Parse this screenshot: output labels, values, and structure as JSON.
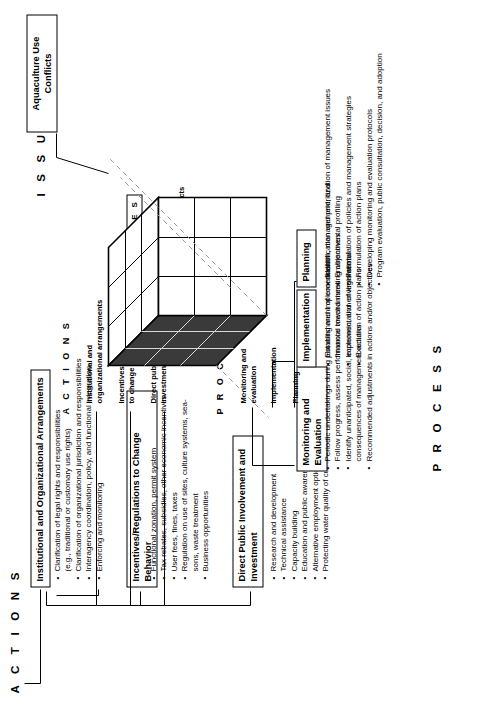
{
  "figure": {
    "axis_actions": "A C T I O N S",
    "axis_issues": "I S S U E S",
    "axis_process": "P R O C E S S",
    "axis_issues_small": "I S S U E S",
    "axis_actions_small": "A C T I O N S",
    "axis_process_small": "P R O C E S S"
  },
  "actions": {
    "groups": [
      {
        "title": "Institutional and Organizational Arrangements",
        "bullets": [
          "Clarification of legal rights and responsibilities",
          "(e.g., traditional or customary use rights)",
          "Clarification of organizational jurisdiction and responsibilities",
          "Interagency coordination, policy, and functional integration",
          "Enforcing and monitoring"
        ]
      },
      {
        "title": "Incentives/Regulations to Change Behavior",
        "bullets": [
          "Functional zonation, permit system",
          "Tax rebates, subsidies, other economic incentives",
          "User fees, fines, taxes",
          "Regulation on use of sites, culture systems, sea-",
          "sons, waste treatment",
          "Business opportunities"
        ]
      },
      {
        "title": "Direct Public Involvement and Investment",
        "bullets": [
          "Research and development",
          "Technical assistance",
          "Capacity building",
          "Education and public awareness",
          "Alternative employment options",
          "Protecting water quality of culture site"
        ]
      }
    ],
    "cube_face_labels": [
      "Institutional and",
      "organizational arrangements",
      "Incentives/regulations",
      "to change behavior",
      "Direct public involvement/",
      "investment"
    ]
  },
  "issues": {
    "callout": "Aquaculture Use Conflicts",
    "cube_face_labels": [
      "Pollution",
      "Overfishing",
      "Aquaculture use conflicts"
    ]
  },
  "process": {
    "groups": [
      {
        "title": "Monitoring and Evaluation",
        "bullets": [
          "Periodic undertakings during planning and implementation",
          "Follow progress, assess performance toward meeting objectives",
          "Identify unanticipated, social, economic, and environmental",
          "consequences of management actions",
          "Recommended adjustments in actions and/or objectives"
        ]
      },
      {
        "title": "Implementation",
        "bullets": [
          "Establishment of coordination, management, and",
          "financial mechanisms",
          "Implementation of legislation",
          "Execution of action plans"
        ]
      },
      {
        "title": "Planning",
        "bullets": [
          "Identification and prioritization of management issues",
          "Environmental profiling",
          "Formulation of policies and management strategies",
          "Formulation of action plans",
          "Developing monitoring and evaluation protocols",
          "Program evaluation, public consultation, decision, and adoption"
        ]
      }
    ],
    "cube_face_labels": [
      "Monitoring and",
      "evaluation",
      "Implementation",
      "Planning"
    ]
  },
  "colors": {
    "ink": "#000000",
    "paper": "#ffffff",
    "cube_dark": "#3a3a3a",
    "cube_light": "#ffffff"
  }
}
